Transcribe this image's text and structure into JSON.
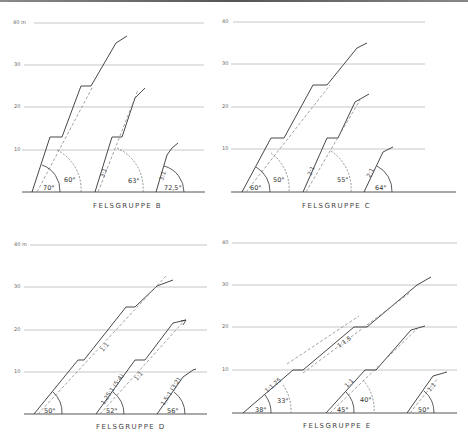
{
  "figure": {
    "panels": [
      {
        "id": "B",
        "title": "FELSGRUPPE   B",
        "y_axis_labels": [
          "40 m",
          "30",
          "20",
          "10"
        ],
        "slopes": [
          {
            "overall_angle": "70°",
            "face_angle_dashed": "60°",
            "ratio": ""
          },
          {
            "overall_angle": "63°",
            "ratio": "3:1"
          },
          {
            "overall_angle": "72,5°",
            "ratio": "3:1"
          }
        ]
      },
      {
        "id": "C",
        "title": "FELSGRUPPE   C",
        "y_axis_labels": [
          "40",
          "30",
          "20",
          "10"
        ],
        "slopes": [
          {
            "overall_angle": "60°",
            "face_angle_dashed": "50°",
            "ratio": ""
          },
          {
            "overall_angle": "55°",
            "ratio": "2:1"
          },
          {
            "overall_angle": "64°",
            "ratio": "2:1"
          }
        ]
      },
      {
        "id": "D",
        "title": "FELSGRUPPE   D",
        "y_axis_labels": [
          "40 m",
          "30",
          "20",
          "10"
        ],
        "slopes": [
          {
            "overall_angle": "50°",
            "ratio": "1:1"
          },
          {
            "overall_angle": "52°",
            "ratio": "1,25:1 (5:4)",
            "ratio2": "1:1"
          },
          {
            "overall_angle": "56°",
            "ratio": "1,5:1 (3:2)"
          }
        ]
      },
      {
        "id": "E",
        "title": "FELSGRUPPE   E",
        "y_axis_labels": [
          "40",
          "30",
          "20",
          "10"
        ],
        "slopes": [
          {
            "overall_angle": "38°",
            "face_angle_dashed": "33°",
            "ratio": "1:1,25",
            "ratio2": "1:1,5"
          },
          {
            "overall_angle": "45°",
            "face_angle_dashed": "40°",
            "ratio": "1:1"
          },
          {
            "overall_angle": "50°",
            "ratio": "1:1"
          }
        ]
      }
    ]
  },
  "colors": {
    "line": "#333333",
    "grid": "#b8b8b8",
    "dashed": "#8a8a8a",
    "background": "#ffffff"
  }
}
